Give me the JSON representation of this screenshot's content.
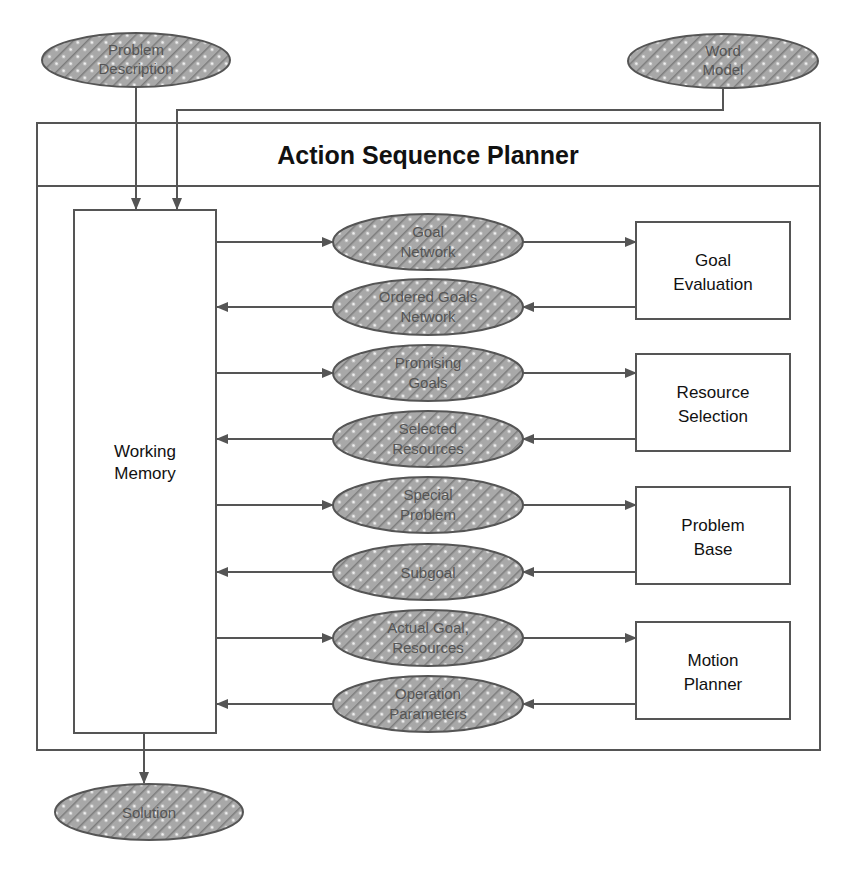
{
  "diagram": {
    "title": "Action Sequence Planner",
    "inputs": [
      {
        "id": "problem-description",
        "lines": [
          "Problem",
          "Description"
        ]
      },
      {
        "id": "word-model",
        "lines": [
          "Word",
          "Model"
        ]
      }
    ],
    "output": {
      "id": "solution",
      "lines": [
        "Solution"
      ]
    },
    "working_memory": {
      "lines": [
        "Working",
        "Memory"
      ]
    },
    "modules": [
      {
        "id": "goal-evaluation",
        "lines": [
          "Goal",
          "Evaluation"
        ]
      },
      {
        "id": "resource-selection",
        "lines": [
          "Resource",
          "Selection"
        ]
      },
      {
        "id": "problem-base",
        "lines": [
          "Problem",
          "Base"
        ]
      },
      {
        "id": "motion-planner",
        "lines": [
          "Motion",
          "Planner"
        ]
      }
    ],
    "flows": [
      {
        "id": "goal-network",
        "lines": [
          "Goal",
          "Network"
        ],
        "direction": "to-module"
      },
      {
        "id": "ordered-goals-network",
        "lines": [
          "Ordered Goals",
          "Network"
        ],
        "direction": "to-memory"
      },
      {
        "id": "promising-goals",
        "lines": [
          "Promising",
          "Goals"
        ],
        "direction": "to-module"
      },
      {
        "id": "selected-resources",
        "lines": [
          "Selected",
          "Resources"
        ],
        "direction": "to-memory"
      },
      {
        "id": "special-problem",
        "lines": [
          "Special",
          "Problem"
        ],
        "direction": "to-module"
      },
      {
        "id": "subgoal",
        "lines": [
          "Subgoal"
        ],
        "direction": "to-memory"
      },
      {
        "id": "actual-goal-resources",
        "lines": [
          "Actual Goal,",
          "Resources"
        ],
        "direction": "to-module"
      },
      {
        "id": "operation-parameters",
        "lines": [
          "Operation",
          "Parameters"
        ],
        "direction": "to-memory"
      }
    ]
  },
  "colors": {
    "line": "#555555",
    "hatch_bg": "#9a9a9a",
    "hatch_fg": "#e0e0e0",
    "text_dark": "#111111",
    "text_ellipse": "#555555"
  }
}
